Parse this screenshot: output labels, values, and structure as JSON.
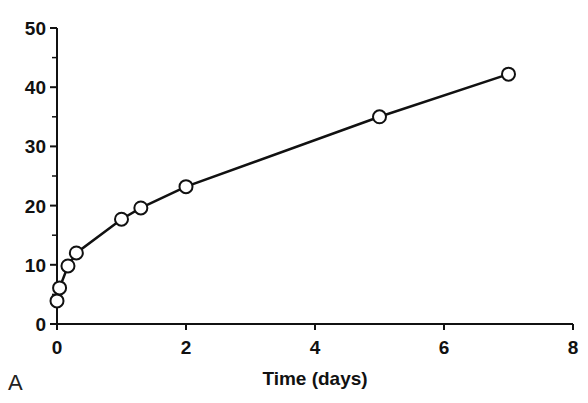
{
  "chart_data": {
    "type": "line",
    "title": "",
    "panel_label": "A",
    "xlabel": "Time (days)",
    "ylabel": "",
    "xlim": [
      0,
      8
    ],
    "ylim": [
      0,
      50
    ],
    "x_ticks": [
      0,
      2,
      4,
      6,
      8
    ],
    "y_ticks": [
      0,
      10,
      20,
      30,
      40,
      50
    ],
    "grid": false,
    "legend": null,
    "series": [
      {
        "name": "series-1",
        "marker": "open-circle",
        "x": [
          0,
          0.04,
          0.17,
          0.3,
          1,
          1.3,
          2,
          5,
          7
        ],
        "y": [
          3.9,
          6.1,
          9.8,
          12,
          17.7,
          19.6,
          23.2,
          35,
          42.2
        ]
      }
    ]
  }
}
